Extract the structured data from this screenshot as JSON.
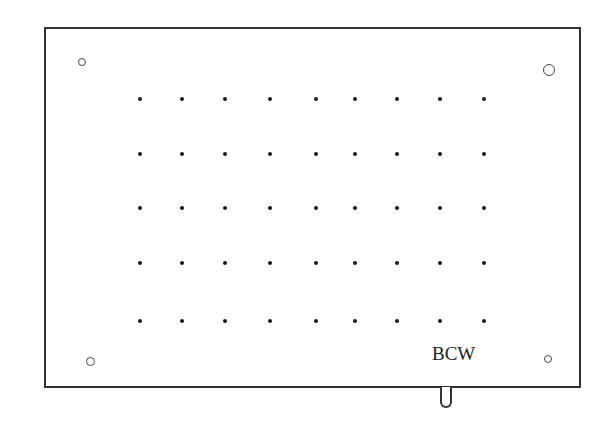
{
  "diagram": {
    "title": "",
    "board": {
      "shape": "rectangle",
      "line_color": "#333333"
    },
    "label": "BCW",
    "mounting_holes": [
      {
        "name": "top-left",
        "x": 82,
        "y": 62,
        "d": 8
      },
      {
        "name": "top-right",
        "x": 549,
        "y": 70,
        "d": 12
      },
      {
        "name": "bottom-left",
        "x": 90,
        "y": 361,
        "d": 9
      },
      {
        "name": "bottom-right",
        "x": 548,
        "y": 359,
        "d": 8
      }
    ],
    "dot_grid": {
      "columns": 9,
      "rows": 5,
      "x": [
        140,
        182,
        225,
        270,
        316,
        355,
        397,
        440,
        484
      ],
      "y": [
        99,
        154,
        208,
        263,
        321
      ],
      "dot_color": "#1a1a1a"
    },
    "tab": {
      "position": "bottom",
      "x": 446
    }
  }
}
